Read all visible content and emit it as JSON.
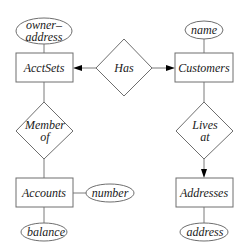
{
  "diagram": {
    "type": "entity-relationship",
    "entities": {
      "acctsets": "AcctSets",
      "customers": "Customers",
      "accounts": "Accounts",
      "addresses": "Addresses"
    },
    "relationships": {
      "has": "Has",
      "member_of": {
        "line1": "Member",
        "line2": "of"
      },
      "lives_at": {
        "line1": "Lives",
        "line2": "at"
      }
    },
    "attributes": {
      "owner_address": {
        "line1": "owner–",
        "line2": "address"
      },
      "name": "name",
      "number": "number",
      "balance": "balance",
      "address": "address"
    },
    "edges": [
      {
        "from": "owner-address",
        "to": "AcctSets",
        "arrow": false
      },
      {
        "from": "name",
        "to": "Customers",
        "arrow": false
      },
      {
        "from": "Has",
        "to": "AcctSets",
        "arrow": true
      },
      {
        "from": "Has",
        "to": "Customers",
        "arrow": true
      },
      {
        "from": "AcctSets",
        "to": "Member of",
        "arrow": false
      },
      {
        "from": "Member of",
        "to": "Accounts",
        "arrow": false
      },
      {
        "from": "Customers",
        "to": "Lives at",
        "arrow": false
      },
      {
        "from": "Lives at",
        "to": "Addresses",
        "arrow": true
      },
      {
        "from": "Accounts",
        "to": "number",
        "arrow": false
      },
      {
        "from": "Accounts",
        "to": "balance",
        "arrow": false
      },
      {
        "from": "Addresses",
        "to": "address",
        "arrow": false
      }
    ]
  }
}
